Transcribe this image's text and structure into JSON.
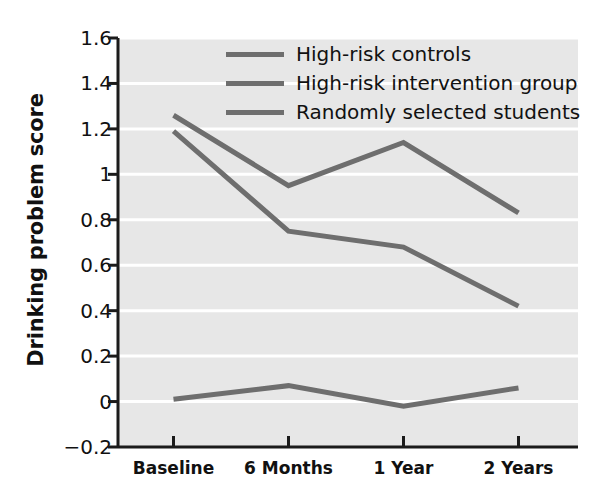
{
  "chart_data": {
    "type": "line",
    "title": "",
    "xlabel": "",
    "ylabel": "Drinking problem score",
    "categories": [
      "Baseline",
      "6 Months",
      "1 Year",
      "2 Years"
    ],
    "ylim": [
      -0.2,
      1.6
    ],
    "yticks": [
      "1.6",
      "1.4",
      "1.2",
      "1",
      "0.8",
      "0.6",
      "0.4",
      "0.2",
      "0",
      "−0.2"
    ],
    "ytick_values": [
      1.6,
      1.4,
      1.2,
      1.0,
      0.8,
      0.6,
      0.4,
      0.2,
      0.0,
      -0.2
    ],
    "grid": "horizontal-white-gridlines",
    "legend_position": "upper-center",
    "plot_background": "#e7e7e7",
    "series": [
      {
        "name": "High-risk controls",
        "color": "#6e6e6e",
        "values": [
          1.26,
          0.95,
          1.14,
          0.83
        ]
      },
      {
        "name": "High-risk intervention group",
        "color": "#6e6e6e",
        "values": [
          1.19,
          0.75,
          0.68,
          0.42
        ]
      },
      {
        "name": "Randomly selected students",
        "color": "#6e6e6e",
        "values": [
          0.01,
          0.07,
          -0.02,
          0.06
        ]
      }
    ]
  },
  "axis": {
    "spine_color": "#1b1b1b",
    "gridline_color": "#ffffff"
  }
}
